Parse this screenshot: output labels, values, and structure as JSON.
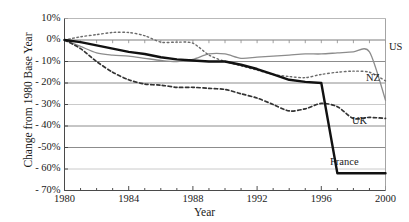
{
  "chart_data": {
    "type": "line",
    "title": "",
    "xlabel": "Year",
    "ylabel": "Change from 1980 Base Year",
    "xlim": [
      1980,
      2000
    ],
    "ylim": [
      -70,
      10
    ],
    "grid": true,
    "legend_position": "inline-right",
    "x_ticks": [
      "1980",
      "1984",
      "1988",
      "1992",
      "1996",
      "2000"
    ],
    "x_tick_values": [
      1980,
      1984,
      1988,
      1992,
      1996,
      2000
    ],
    "y_ticks": [
      "10%",
      "0%",
      "- 10%",
      "- 20%",
      "- 30%",
      "- 40%",
      "-50%",
      "- 60%",
      "- 70%"
    ],
    "y_tick_values": [
      10,
      0,
      -10,
      -20,
      -30,
      -40,
      -50,
      -60,
      -70
    ],
    "x": [
      1980,
      1981,
      1982,
      1983,
      1984,
      1985,
      1986,
      1987,
      1988,
      1989,
      1990,
      1991,
      1992,
      1993,
      1994,
      1995,
      1996,
      1997,
      1998,
      1999,
      2000
    ],
    "series": [
      {
        "name": "US",
        "label": "US",
        "color": "#8c8c8c",
        "style": "solid",
        "width": 1.3,
        "values": [
          0,
          -3,
          -6,
          -7,
          -7.5,
          -8.5,
          -9.5,
          -10,
          -9,
          -6.5,
          -6.5,
          -8.5,
          -8,
          -7.5,
          -7,
          -6.5,
          -6.5,
          -6,
          -5.5,
          -5.5,
          -28
        ]
      },
      {
        "name": "NZ",
        "label": "NZ",
        "color": "#6b6b6b",
        "style": "dotted",
        "width": 1.4,
        "values": [
          0,
          1.5,
          2.5,
          3.5,
          3.5,
          2,
          -1,
          -1,
          -1.5,
          -7,
          -10,
          -12,
          -14,
          -16,
          -17,
          -17.5,
          -16,
          -15,
          -14.5,
          -15,
          -19
        ]
      },
      {
        "name": "UK",
        "label": "UK",
        "color": "#333333",
        "style": "dashed",
        "width": 1.7,
        "values": [
          0,
          -4,
          -10,
          -15,
          -18.5,
          -20.5,
          -21,
          -22,
          -22,
          -22.5,
          -23,
          -25,
          -27,
          -30,
          -33,
          -32,
          -29.5,
          -31,
          -36.5,
          -36,
          -36.5
        ]
      },
      {
        "name": "France",
        "label": "France",
        "color": "#111111",
        "style": "solid",
        "width": 2.4,
        "values": [
          0,
          -1,
          -2.5,
          -4,
          -5.5,
          -6.5,
          -8,
          -9,
          -9.5,
          -10,
          -10,
          -11.5,
          -13.5,
          -16,
          -18.5,
          -19.5,
          -20,
          -62,
          -62,
          -62,
          -62
        ]
      }
    ]
  },
  "axis": {
    "ylabel_text": "Change from 1980 Base Year",
    "xlabel_text": "Year"
  }
}
